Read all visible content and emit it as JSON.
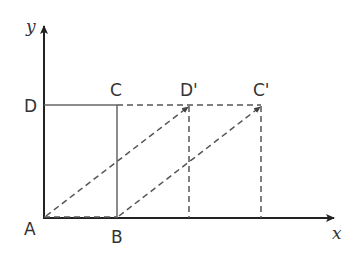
{
  "diagram": {
    "axes": {
      "x_label": "x",
      "y_label": "y"
    },
    "points": {
      "A": "A",
      "B": "B",
      "C": "C",
      "D": "D",
      "D_prime": "D'",
      "C_prime": "C'"
    },
    "colors": {
      "line": "#444444",
      "dashed": "#555555",
      "text": "#333333"
    }
  }
}
